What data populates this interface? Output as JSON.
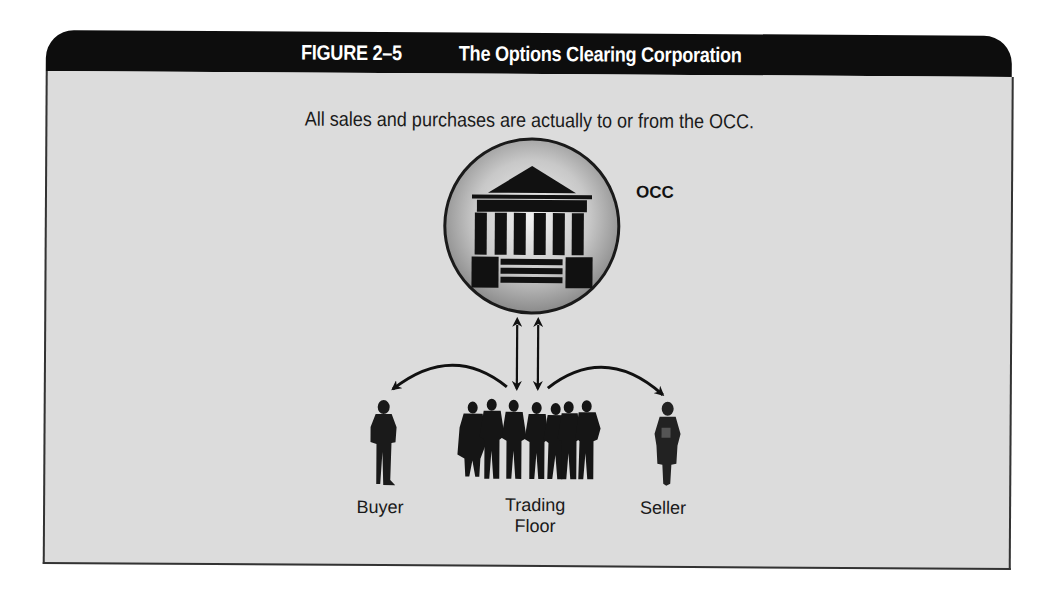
{
  "figure": {
    "number": "FIGURE 2–5",
    "title": "The Options Clearing Corporation",
    "subtitle": "All sales and purchases are actually to or from the OCC."
  },
  "nodes": {
    "occ": {
      "label": "OCC",
      "icon": "bank-building-icon"
    },
    "buyer": {
      "label": "Buyer",
      "icon": "person-silhouette-icon"
    },
    "trading_floor": {
      "label_line1": "Trading",
      "label_line2": "Floor",
      "icon": "group-silhouette-icon"
    },
    "seller": {
      "label": "Seller",
      "icon": "person-silhouette-icon"
    }
  },
  "edges": [
    {
      "from": "trading_floor",
      "to": "occ",
      "type": "two-way-arrow"
    },
    {
      "from": "occ",
      "to": "trading_floor",
      "type": "two-way-arrow"
    },
    {
      "from": "trading_floor",
      "to": "buyer",
      "type": "curved-arrow"
    },
    {
      "from": "trading_floor",
      "to": "seller",
      "type": "curved-arrow"
    }
  ],
  "colors": {
    "header_bg": "#0d0d0d",
    "panel_bg": "#dcdcdc",
    "ink": "#111111"
  }
}
